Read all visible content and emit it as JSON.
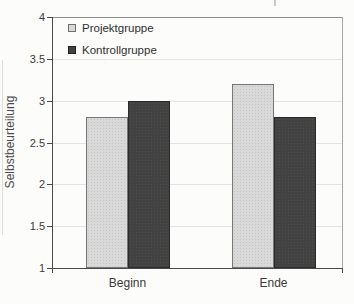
{
  "chart_data": {
    "type": "bar",
    "title": "",
    "categories": [
      "Beginn",
      "Ende"
    ],
    "series": [
      {
        "name": "Projektgruppe",
        "values": [
          2.8,
          3.2
        ],
        "color": "#d9d9d9"
      },
      {
        "name": "Kontrollgruppe",
        "values": [
          3.0,
          2.8
        ],
        "color": "#424242"
      }
    ],
    "xlabel": "",
    "ylabel": "Selbstbeurteilung",
    "ylim": [
      1,
      4
    ],
    "ytick_step": 0.5,
    "ytick_labels": [
      "1",
      "1.5",
      "2",
      "2.5",
      "3",
      "3.5",
      "4"
    ],
    "grid": true,
    "legend_position": "top-left",
    "colors": {
      "axis": "#4a4a4a",
      "frame": "#8f8f8f",
      "gridline": "#e4e4e4",
      "text": "#3a3a3a",
      "background": "#fcfcfb"
    }
  }
}
